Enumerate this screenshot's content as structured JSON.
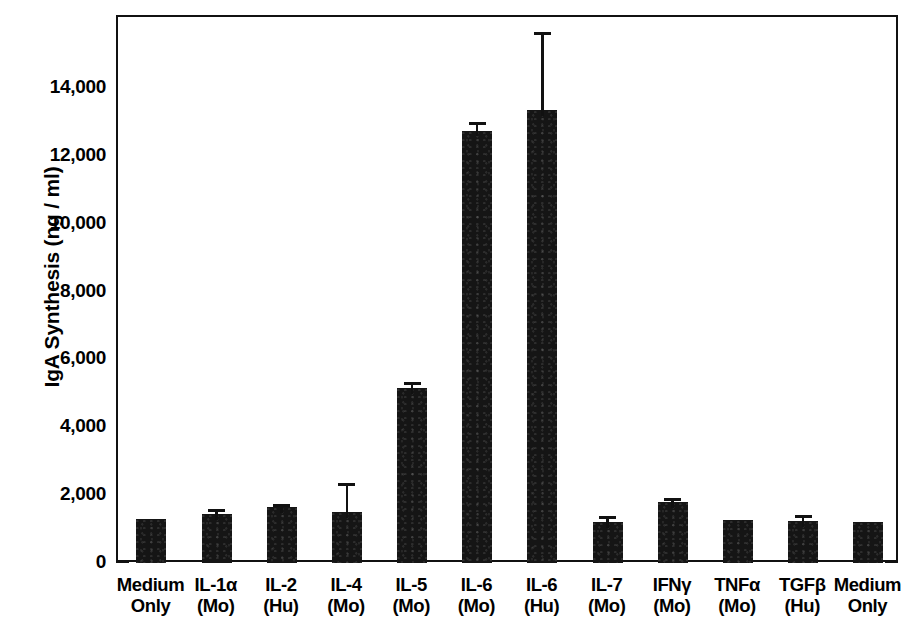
{
  "chart_data": {
    "type": "bar",
    "title": "",
    "xlabel": "",
    "ylabel": "IgA Synthesis (ng / ml)",
    "ylim": [
      0,
      15600
    ],
    "ytick_labels": [
      "0",
      "2,000",
      "4,000",
      "6,000",
      "8,000",
      "10,000",
      "12,000",
      "14,000"
    ],
    "ytick_values": [
      0,
      2000,
      4000,
      6000,
      8000,
      10000,
      12000,
      14000
    ],
    "grid": false,
    "legend": "none",
    "categories": [
      "Medium Only",
      "IL-1α (Mo)",
      "IL-2 (Hu)",
      "IL-4 (Mo)",
      "IL-5 (Mo)",
      "IL-6 (Mo)",
      "IL-6 (Hu)",
      "IL-7 (Mo)",
      "IFNγ (Mo)",
      "TNFα (Mo)",
      "TGFβ (Hu)",
      "Medium Only"
    ],
    "category_lines": [
      [
        "Medium",
        "Only"
      ],
      [
        "IL-1α",
        "(Mo)"
      ],
      [
        "IL-2",
        "(Hu)"
      ],
      [
        "IL-4",
        "(Mo)"
      ],
      [
        "IL-5",
        "(Mo)"
      ],
      [
        "IL-6",
        "(Mo)"
      ],
      [
        "IL-6",
        "(Hu)"
      ],
      [
        "IL-7",
        "(Mo)"
      ],
      [
        "IFNγ",
        "(Mo)"
      ],
      [
        "TNFα",
        "(Mo)"
      ],
      [
        "TGFβ",
        "(Hu)"
      ],
      [
        "Medium",
        "Only"
      ]
    ],
    "values": [
      1280,
      1450,
      1640,
      1500,
      5140,
      12740,
      13350,
      1200,
      1790,
      1250,
      1240,
      1190
    ],
    "errors_upper": [
      0,
      1590,
      1740,
      2360,
      5330,
      12980,
      15650,
      1380,
      1900,
      1250,
      1400,
      0
    ],
    "has_error_bar": [
      false,
      true,
      true,
      true,
      true,
      true,
      true,
      true,
      true,
      false,
      true,
      false
    ],
    "bar_color": "#151515",
    "axis_color": "#111111",
    "background": "#ffffff"
  }
}
